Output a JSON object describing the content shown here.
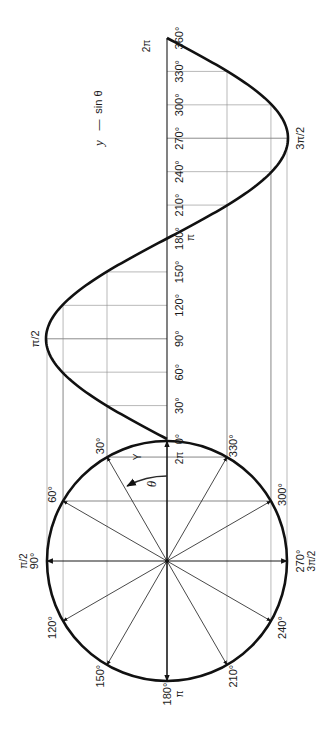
{
  "figure": {
    "equation_label": {
      "lhs": "y",
      "dash": "—",
      "rhs": "sin θ"
    },
    "theta_symbol": "θ",
    "y_symbol": "Y",
    "colors": {
      "ink": "#111111",
      "grid": "#8a8a8a",
      "background": "#ffffff"
    }
  },
  "axis_labels": [
    {
      "deg": 0,
      "text": "0°"
    },
    {
      "deg": 30,
      "text": "30°"
    },
    {
      "deg": 60,
      "text": "60°"
    },
    {
      "deg": 90,
      "text": "90°"
    },
    {
      "deg": 120,
      "text": "120°"
    },
    {
      "deg": 150,
      "text": "150°"
    },
    {
      "deg": 180,
      "text": "180°"
    },
    {
      "deg": 210,
      "text": "210°"
    },
    {
      "deg": 240,
      "text": "240°"
    },
    {
      "deg": 270,
      "text": "270°"
    },
    {
      "deg": 300,
      "text": "300°"
    },
    {
      "deg": 330,
      "text": "330°"
    },
    {
      "deg": 360,
      "text": "360°"
    }
  ],
  "axis_radian_labels": [
    {
      "deg": 180,
      "text": "π"
    },
    {
      "deg": 360,
      "text": "2π"
    }
  ],
  "curve_labels": [
    {
      "deg": 90,
      "text": "π/2"
    },
    {
      "deg": 270,
      "text": "3π/2"
    }
  ],
  "circle_labels": [
    {
      "deg": 0,
      "text": "2π",
      "sub": ""
    },
    {
      "deg": 30,
      "text": "30°",
      "sub": ""
    },
    {
      "deg": 60,
      "text": "60°",
      "sub": ""
    },
    {
      "deg": 90,
      "text": "90°",
      "sub": "π/2"
    },
    {
      "deg": 120,
      "text": "120°",
      "sub": ""
    },
    {
      "deg": 150,
      "text": "150°",
      "sub": ""
    },
    {
      "deg": 180,
      "text": "180°",
      "sub": "π"
    },
    {
      "deg": 210,
      "text": "210°",
      "sub": ""
    },
    {
      "deg": 240,
      "text": "240°",
      "sub": ""
    },
    {
      "deg": 270,
      "text": "270°",
      "sub": "3π/2"
    },
    {
      "deg": 300,
      "text": "300°",
      "sub": ""
    },
    {
      "deg": 330,
      "text": "330°",
      "sub": ""
    }
  ],
  "chart_data": {
    "type": "line",
    "xlabel": "θ (degrees)",
    "ylabel": "y",
    "x": [
      0,
      30,
      60,
      90,
      120,
      150,
      180,
      210,
      240,
      270,
      300,
      330,
      360
    ],
    "values": [
      0,
      0.5,
      0.866,
      1,
      0.866,
      0.5,
      0,
      -0.5,
      -0.866,
      -1,
      -0.866,
      -0.5,
      0
    ],
    "xlim": [
      0,
      360
    ],
    "ylim": [
      -1,
      1
    ],
    "orientation": "rotated 90° counter-clockwise",
    "unit_circle": {
      "radii_deg": [
        0,
        30,
        60,
        90,
        120,
        150,
        180,
        210,
        240,
        270,
        300,
        330
      ],
      "projection_lines": true
    },
    "grid": true
  }
}
